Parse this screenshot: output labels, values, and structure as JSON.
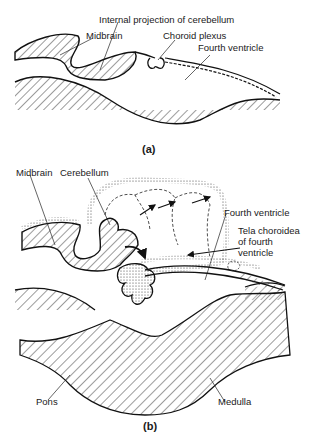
{
  "figure": {
    "panel_a": {
      "caption": "(a)",
      "labels": {
        "internal_projection": "Internal projection of cerebellum",
        "midbrain": "Midbrain",
        "choroid_plexus": "Choroid plexus",
        "fourth_ventricle": "Fourth ventricle"
      }
    },
    "panel_b": {
      "caption": "(b)",
      "labels": {
        "midbrain": "Midbrain",
        "cerebellum": "Cerebellum",
        "fourth_ventricle": "Fourth ventricle",
        "tela_line1": "Tela choroidea",
        "tela_line2": "of fourth",
        "tela_line3": "ventricle",
        "pons": "Pons",
        "medulla": "Medulla"
      }
    }
  }
}
